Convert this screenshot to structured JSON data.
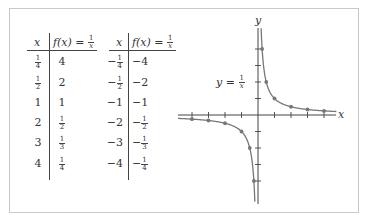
{
  "tables": [
    {
      "header": {
        "x": "x",
        "fx": "f(x) =",
        "fx_num": "1",
        "fx_den": "x"
      },
      "rows": [
        {
          "x": {
            "sign": "",
            "num": "1",
            "den": "4"
          },
          "fx": {
            "sign": "",
            "int": "4"
          }
        },
        {
          "x": {
            "sign": "",
            "num": "1",
            "den": "2"
          },
          "fx": {
            "sign": "",
            "int": "2"
          }
        },
        {
          "x": {
            "sign": "",
            "int": "1"
          },
          "fx": {
            "sign": "",
            "int": "1"
          }
        },
        {
          "x": {
            "sign": "",
            "int": "2"
          },
          "fx": {
            "sign": "",
            "num": "1",
            "den": "2"
          }
        },
        {
          "x": {
            "sign": "",
            "int": "3"
          },
          "fx": {
            "sign": "",
            "num": "1",
            "den": "3"
          }
        },
        {
          "x": {
            "sign": "",
            "int": "4"
          },
          "fx": {
            "sign": "",
            "num": "1",
            "den": "4"
          }
        }
      ]
    },
    {
      "header": {
        "x": "x",
        "fx": "f(x) =",
        "fx_num": "1",
        "fx_den": "x"
      },
      "rows": [
        {
          "x": {
            "sign": "−",
            "num": "1",
            "den": "4"
          },
          "fx": {
            "sign": "",
            "int": "−4"
          }
        },
        {
          "x": {
            "sign": "−",
            "num": "1",
            "den": "2"
          },
          "fx": {
            "sign": "",
            "int": "−2"
          }
        },
        {
          "x": {
            "sign": "",
            "int": "−1"
          },
          "fx": {
            "sign": "",
            "int": "−1"
          }
        },
        {
          "x": {
            "sign": "",
            "int": "−2"
          },
          "fx": {
            "sign": "−",
            "num": "1",
            "den": "2"
          }
        },
        {
          "x": {
            "sign": "",
            "int": "−3"
          },
          "fx": {
            "sign": "−",
            "num": "1",
            "den": "3"
          }
        },
        {
          "x": {
            "sign": "",
            "int": "−4"
          },
          "fx": {
            "sign": "−",
            "num": "1",
            "den": "4"
          }
        }
      ]
    }
  ],
  "graph": {
    "x_axis_label": "x",
    "y_axis_label": "y",
    "curve_label": "y =",
    "curve_label_num": "1",
    "curve_label_den": "x",
    "colors": {
      "axis": "#444444",
      "curve": "#777777",
      "point": "#777777"
    }
  },
  "chart_data": {
    "type": "line",
    "title": "",
    "function": "f(x) = 1/x",
    "xlabel": "x",
    "ylabel": "y",
    "annotation": "y = 1/x",
    "xlim": [
      -4.8,
      4.8
    ],
    "ylim": [
      -5.2,
      5.2
    ],
    "x_ticks": [
      -4,
      -3,
      -2,
      -1,
      1,
      2,
      3,
      4
    ],
    "y_ticks": [
      -4,
      -3,
      -2,
      -1,
      1,
      2,
      3,
      4
    ],
    "tick_labels_shown": false,
    "grid": false,
    "series": [
      {
        "name": "points (x > 0)",
        "x": [
          0.25,
          0.5,
          1,
          2,
          3,
          4
        ],
        "y": [
          4,
          2,
          1,
          0.5,
          0.3333,
          0.25
        ]
      },
      {
        "name": "points (x < 0)",
        "x": [
          -0.25,
          -0.5,
          -1,
          -2,
          -3,
          -4
        ],
        "y": [
          -4,
          -2,
          -1,
          -0.5,
          -0.3333,
          -0.25
        ]
      }
    ]
  }
}
